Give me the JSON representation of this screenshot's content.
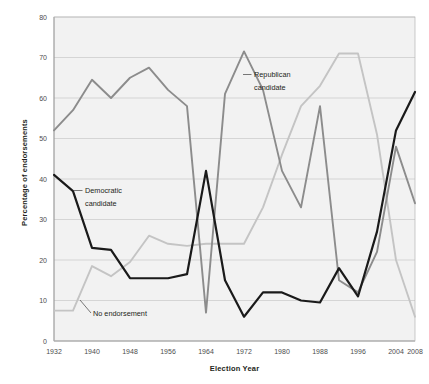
{
  "chart_data": {
    "type": "line",
    "title": "",
    "xlabel": "Election Year",
    "ylabel": "Percentage of endorsements",
    "xlim": [
      1932,
      2008
    ],
    "ylim": [
      0,
      80
    ],
    "grid": true,
    "legend_position": "inline-annotations",
    "x": [
      1932,
      1936,
      1940,
      1944,
      1948,
      1952,
      1956,
      1960,
      1964,
      1968,
      1972,
      1976,
      1980,
      1984,
      1988,
      1992,
      1996,
      2000,
      2004,
      2008
    ],
    "xticks": [
      "1932",
      "1940",
      "1948",
      "1956",
      "1964",
      "1972",
      "1980",
      "1988",
      "1996",
      "2004",
      "2008"
    ],
    "yticks": [
      "0",
      "10",
      "20",
      "30",
      "40",
      "50",
      "60",
      "70",
      "80"
    ],
    "series": [
      {
        "name": "Republican candidate",
        "color": "#8c8c8c",
        "values": [
          52,
          57,
          64.5,
          60,
          65,
          67.5,
          62,
          58,
          7,
          61,
          71.5,
          62,
          42,
          33,
          58,
          15,
          12,
          22,
          48,
          34
        ]
      },
      {
        "name": "Democratic candidate",
        "color": "#1a1a1a",
        "values": [
          41,
          37,
          23,
          22.5,
          15.5,
          15.5,
          15.5,
          16.5,
          42,
          15,
          6,
          12,
          12,
          10,
          9.5,
          18,
          11,
          27,
          52,
          61.5
        ]
      },
      {
        "name": "No endorsement",
        "color": "#c4c4c4",
        "values": [
          7.5,
          7.5,
          18.5,
          16,
          19.5,
          26,
          24,
          23.5,
          24,
          24,
          24,
          33,
          46,
          58,
          63,
          71,
          71,
          51,
          20,
          6
        ]
      }
    ],
    "annotations": [
      {
        "label": "Republican candidate",
        "series": "Republican candidate"
      },
      {
        "label": "Democratic candidate",
        "series": "Democratic candidate"
      },
      {
        "label": "No endorsement",
        "series": "No endorsement"
      }
    ]
  },
  "colors": {
    "republican": "#8c8c8c",
    "democratic": "#1a1a1a",
    "no_endorsement": "#c4c4c4",
    "plot_background": "#f2f2f2",
    "gridline": "#c9c9c9",
    "axis": "#8a8a8a",
    "text": "#231f20"
  }
}
